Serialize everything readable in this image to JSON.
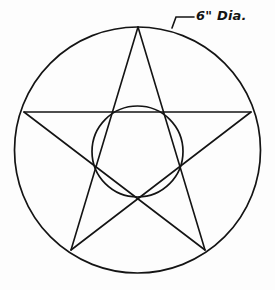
{
  "drawing": {
    "title": "Pentagram inscribed in circle with inner circle",
    "background_color": "#fdfdfd",
    "line_color": "#141414",
    "line_width": 1.6,
    "annotation": {
      "text": "6\" Dia.",
      "value": 6,
      "unit": "inch",
      "label_kind": "diameter",
      "text_x": 196,
      "text_y": 20,
      "leader": {
        "points": "172,28 176,17 194,17",
        "tick_start_x": 172,
        "tick_start_y": 28,
        "elbow_x": 176,
        "elbow_y": 17,
        "shelf_end_x": 194,
        "shelf_end_y": 17
      }
    },
    "outer_circle": {
      "name": "outer-circle",
      "cx": 137.5,
      "cy": 150,
      "r": 123,
      "diameter_in": 6
    },
    "inner_circle": {
      "name": "inner-circle",
      "cx": 137.5,
      "cy": 151.5,
      "r": 45.5
    },
    "star": {
      "name": "pentagram",
      "points": "138,27 251,112 205,250 71,250 24,112",
      "vertices": [
        {
          "label": "top",
          "x": 138,
          "y": 27
        },
        {
          "label": "right",
          "x": 251,
          "y": 112
        },
        {
          "label": "bottom-right",
          "x": 205,
          "y": 250
        },
        {
          "label": "bottom-left",
          "x": 71,
          "y": 250
        },
        {
          "label": "left",
          "x": 24,
          "y": 112
        }
      ],
      "chords": [
        {
          "from": "top",
          "to": "bottom-right",
          "x1": 138,
          "y1": 27,
          "x2": 205,
          "y2": 250
        },
        {
          "from": "bottom-right",
          "to": "left",
          "x1": 205,
          "y1": 250,
          "x2": 24,
          "y2": 112
        },
        {
          "from": "left",
          "to": "right",
          "x1": 24,
          "y1": 112,
          "x2": 251,
          "y2": 112
        },
        {
          "from": "right",
          "to": "bottom-left",
          "x1": 251,
          "y1": 112,
          "x2": 71,
          "y2": 250
        },
        {
          "from": "bottom-left",
          "to": "top",
          "x1": 71,
          "y1": 250,
          "x2": 138,
          "y2": 27
        }
      ]
    }
  }
}
